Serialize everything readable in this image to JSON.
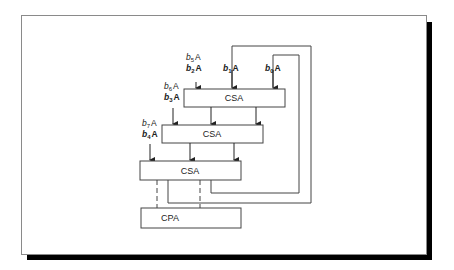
{
  "diagram": {
    "blocks": {
      "csa_top": "CSA",
      "csa_mid": "CSA",
      "csa_bot": "CSA",
      "cpa": "CPA"
    },
    "inputs": {
      "top_left_1": {
        "b": "b",
        "sub": "5",
        "a": "A"
      },
      "top_left_2": {
        "b": "b",
        "sub": "2",
        "a": "A"
      },
      "top_mid": {
        "b": "b",
        "sub": "1",
        "a": "A"
      },
      "top_right": {
        "b": "b",
        "sub": "0",
        "a": "A"
      },
      "mid_left_1": {
        "b": "b",
        "sub": "6",
        "a": "A"
      },
      "mid_left_2": {
        "b": "b",
        "sub": "3",
        "a": "A"
      },
      "bot_left_1": {
        "b": "b",
        "sub": "7",
        "a": "A"
      },
      "bot_left_2": {
        "b": "b",
        "sub": "4",
        "a": "A"
      }
    }
  }
}
